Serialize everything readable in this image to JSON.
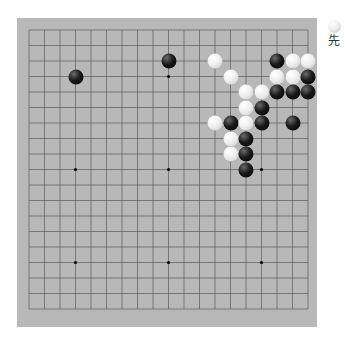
{
  "board": {
    "size": 19,
    "background": "#b8b8b8",
    "line_color": "#5a5a5a",
    "origin_x": 29,
    "origin_y": 30,
    "spacing": 15.5,
    "star_points": [
      [
        3,
        3
      ],
      [
        9,
        3
      ],
      [
        15,
        3
      ],
      [
        3,
        9
      ],
      [
        9,
        9
      ],
      [
        15,
        9
      ],
      [
        3,
        15
      ],
      [
        9,
        15
      ],
      [
        15,
        15
      ]
    ],
    "hidden_star_points": [
      [
        3,
        3
      ],
      [
        15,
        3
      ]
    ],
    "stones": [
      {
        "color": "black",
        "col": 9,
        "row": 2
      },
      {
        "color": "white",
        "col": 12,
        "row": 2
      },
      {
        "color": "black",
        "col": 16,
        "row": 2
      },
      {
        "color": "white",
        "col": 17,
        "row": 2
      },
      {
        "color": "white",
        "col": 18,
        "row": 2
      },
      {
        "color": "black",
        "col": 3,
        "row": 3
      },
      {
        "color": "white",
        "col": 13,
        "row": 3
      },
      {
        "color": "white",
        "col": 16,
        "row": 3
      },
      {
        "color": "white",
        "col": 17,
        "row": 3
      },
      {
        "color": "black",
        "col": 18,
        "row": 3
      },
      {
        "color": "white",
        "col": 14,
        "row": 4
      },
      {
        "color": "white",
        "col": 15,
        "row": 4
      },
      {
        "color": "black",
        "col": 16,
        "row": 4
      },
      {
        "color": "black",
        "col": 17,
        "row": 4
      },
      {
        "color": "black",
        "col": 18,
        "row": 4
      },
      {
        "color": "white",
        "col": 14,
        "row": 5
      },
      {
        "color": "black",
        "col": 15,
        "row": 5
      },
      {
        "color": "white",
        "col": 12,
        "row": 6
      },
      {
        "color": "black",
        "col": 13,
        "row": 6
      },
      {
        "color": "white",
        "col": 14,
        "row": 6
      },
      {
        "color": "black",
        "col": 15,
        "row": 6
      },
      {
        "color": "black",
        "col": 17,
        "row": 6
      },
      {
        "color": "white",
        "col": 13,
        "row": 7
      },
      {
        "color": "black",
        "col": 14,
        "row": 7
      },
      {
        "color": "white",
        "col": 13,
        "row": 8
      },
      {
        "color": "black",
        "col": 14,
        "row": 8
      },
      {
        "color": "black",
        "col": 14,
        "row": 9
      }
    ]
  },
  "turn_indicator": {
    "stone_color": "white",
    "label": "先"
  }
}
